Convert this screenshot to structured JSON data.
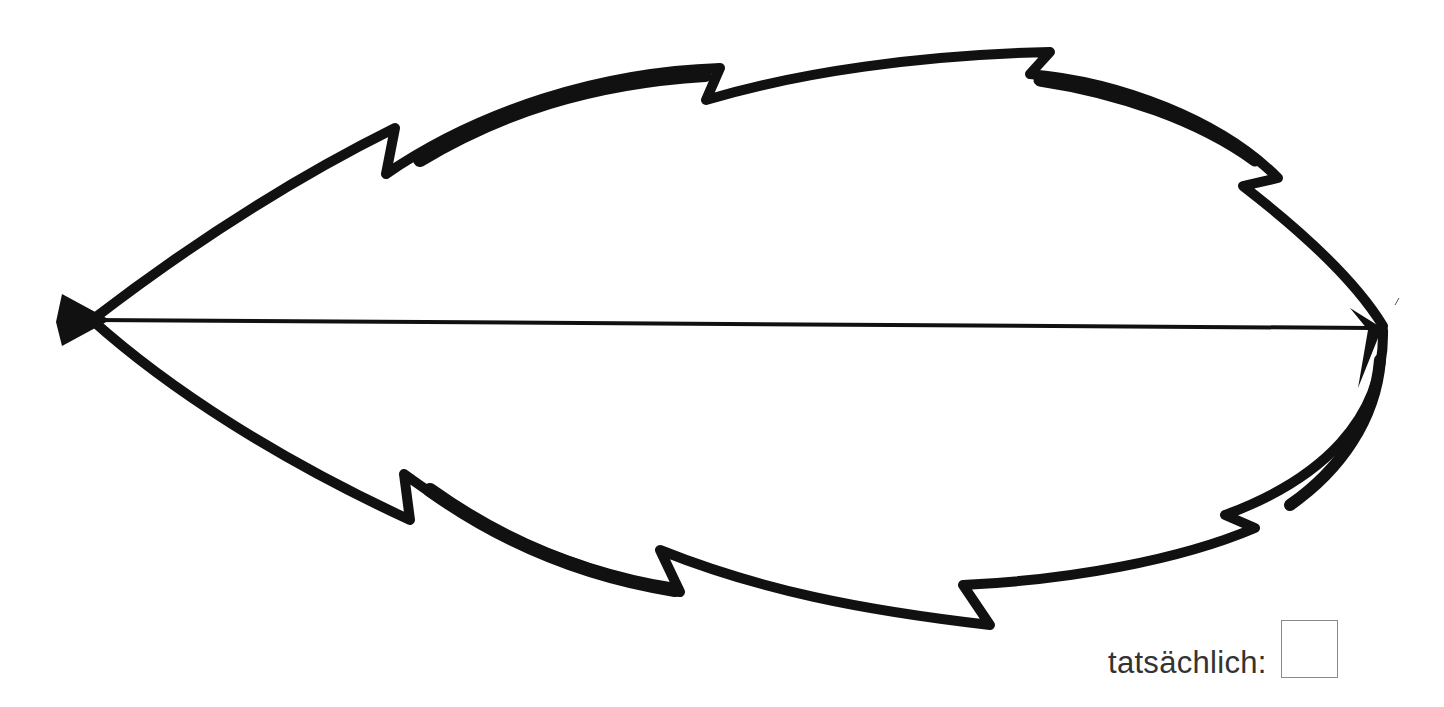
{
  "figure": {
    "outline_color": "#111111",
    "arrow_color": "#111111"
  },
  "answer": {
    "label": "tatsächlich:",
    "value": ""
  }
}
